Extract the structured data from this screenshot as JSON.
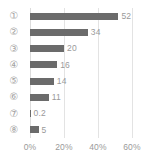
{
  "chart_data": {
    "type": "bar",
    "orientation": "horizontal",
    "title": "",
    "xlabel": "",
    "ylabel": "",
    "categories": [
      "①",
      "②",
      "③",
      "④",
      "⑤",
      "⑥",
      "⑦",
      "⑧"
    ],
    "values": [
      52,
      34,
      20,
      16,
      14,
      11,
      0.2,
      5
    ],
    "value_labels": [
      "52",
      "34",
      "20",
      "16",
      "14",
      "11",
      "0.2",
      "5"
    ],
    "xlim": [
      0,
      60
    ],
    "xticks": [
      0,
      20,
      40,
      60
    ],
    "xtick_labels": [
      "0%",
      "20%",
      "40%",
      "60%"
    ],
    "grid": true,
    "grid_axis": "x",
    "legend": false,
    "unit": "%",
    "colors": {
      "bar": "#6b6b6b",
      "gridline": "#e3e3e3",
      "tick_text": "#9a9a9a",
      "category_text": "#a2a2a2",
      "background": "#ffffff"
    }
  }
}
